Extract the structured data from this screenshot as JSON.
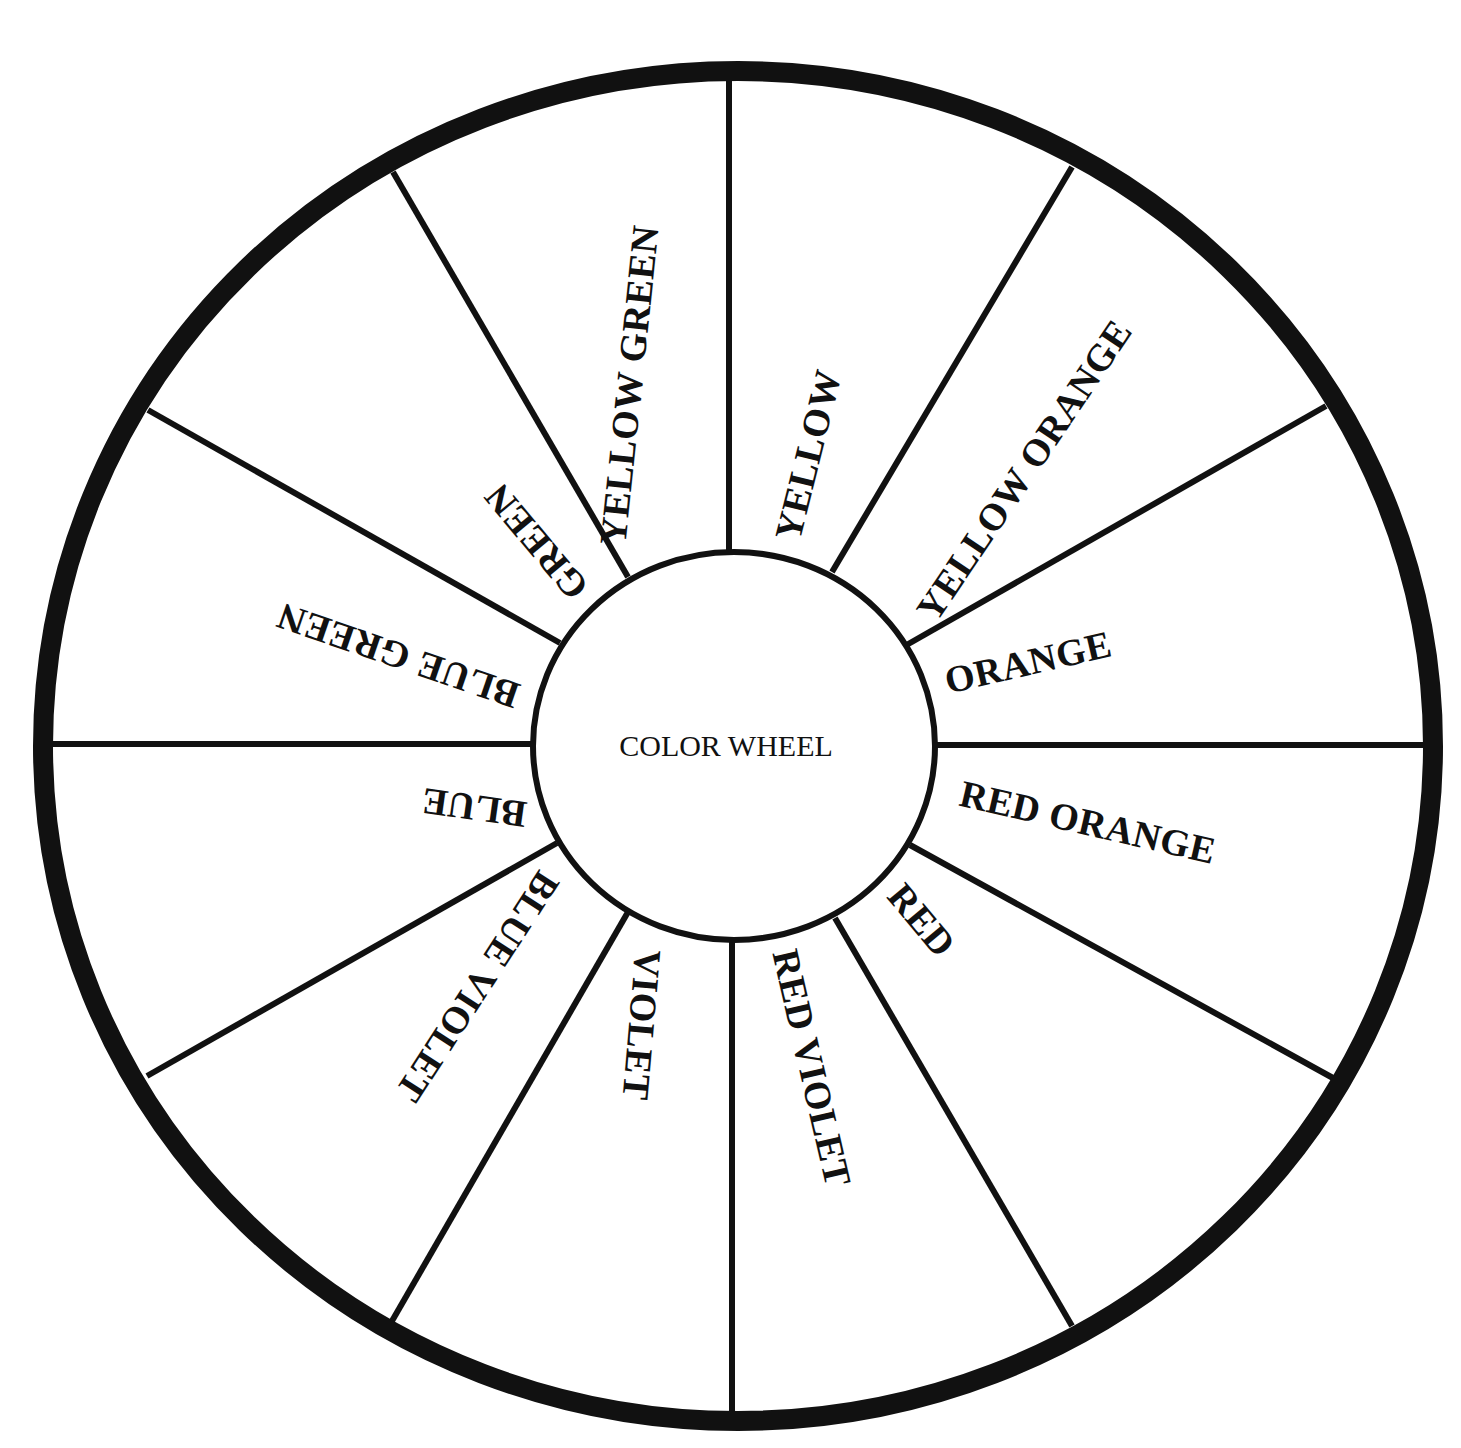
{
  "diagram": {
    "title": "COLOR WHEEL",
    "ink_color": "#111111",
    "background_color": "#ffffff",
    "segments": [
      {
        "label": "YELLOW"
      },
      {
        "label": "YELLOW ORANGE"
      },
      {
        "label": "ORANGE"
      },
      {
        "label": "RED ORANGE"
      },
      {
        "label": "RED"
      },
      {
        "label": "RED VIOLET"
      },
      {
        "label": "VIOLET"
      },
      {
        "label": "BLUE VIOLET"
      },
      {
        "label": "BLUE"
      },
      {
        "label": "BLUE GREEN"
      },
      {
        "label": "GREEN"
      },
      {
        "label": "YELLOW GREEN"
      }
    ]
  }
}
